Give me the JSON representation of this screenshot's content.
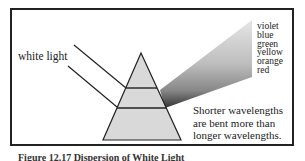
{
  "figure": {
    "input_label": "white light",
    "spectrum_labels": [
      "violet",
      "blue",
      "green",
      "yellow",
      "orange",
      "red"
    ],
    "note_lines": [
      "Shorter wavelengths",
      "are bent more than",
      "longer wavelengths."
    ],
    "caption": "Figure 12.17 Dispersion of White Light"
  }
}
